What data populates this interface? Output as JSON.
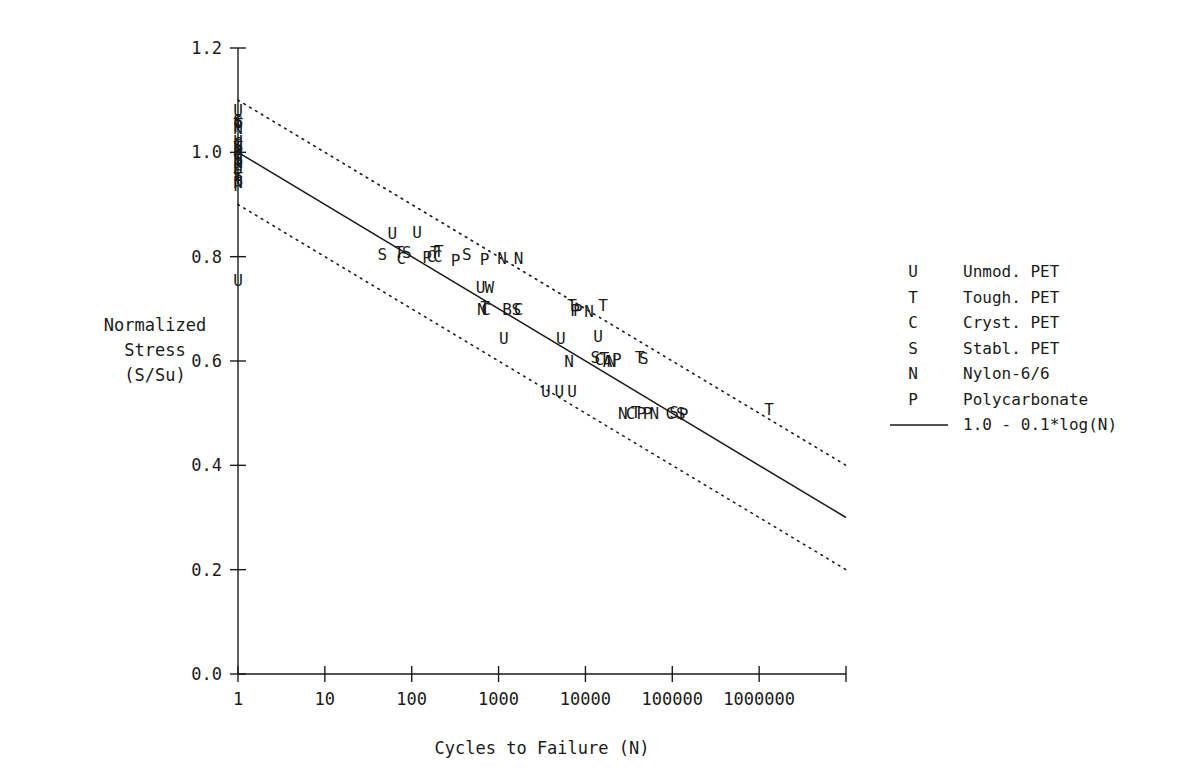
{
  "chart_data": {
    "type": "scatter",
    "title": "",
    "xlabel": "Cycles to Failure  (N)",
    "ylabel_lines": [
      "Normalized",
      "Stress",
      "(S/Su)"
    ],
    "xscale": "log",
    "xlim": [
      1,
      10000000
    ],
    "ylim": [
      0.0,
      1.2
    ],
    "grid": false,
    "x_ticks": [
      1,
      10,
      100,
      1000,
      10000,
      100000,
      1000000,
      10000000
    ],
    "x_tick_labels": [
      "1",
      "10",
      "100",
      "1000",
      "10000",
      "100000",
      "1000000",
      ""
    ],
    "y_ticks": [
      0.0,
      0.2,
      0.4,
      0.6,
      0.8,
      1.0,
      1.2
    ],
    "y_tick_labels": [
      "0.0",
      "0.2",
      "0.4",
      "0.6",
      "0.8",
      "1.0",
      "1.2"
    ],
    "legend_position": "right",
    "series": [
      {
        "name": "Unmod. PET",
        "key": "U"
      },
      {
        "name": "Tough. PET",
        "key": "T"
      },
      {
        "name": "Cryst. PET",
        "key": "C"
      },
      {
        "name": "Stabl. PET",
        "key": "S"
      },
      {
        "name": "Nylon-6/6",
        "key": "N"
      },
      {
        "name": "Polycarbonate",
        "key": "P"
      }
    ],
    "lines": [
      {
        "name": "1.0 - 0.1*log(N)",
        "style": "solid",
        "equation": "S/Su = 1.0 - 0.1*log10(N)",
        "points": [
          [
            1,
            1.0
          ],
          [
            10000000,
            0.3
          ]
        ]
      },
      {
        "name": "upper bound",
        "style": "dotted",
        "equation": "S/Su = 1.1 - 0.1*log10(N)",
        "points": [
          [
            1,
            1.1
          ],
          [
            10000000,
            0.4
          ]
        ]
      },
      {
        "name": "lower bound",
        "style": "dotted",
        "equation": "S/Su = 0.9 - 0.1*log10(N)",
        "points": [
          [
            1,
            0.9
          ],
          [
            10000000,
            0.2
          ]
        ]
      }
    ],
    "points": [
      {
        "k": "U",
        "x": 1,
        "y": 1.082
      },
      {
        "k": "S",
        "x": 1,
        "y": 1.062
      },
      {
        "k": "C",
        "x": 1,
        "y": 1.058
      },
      {
        "k": "T",
        "x": 1,
        "y": 1.054
      },
      {
        "k": "P",
        "x": 1,
        "y": 1.05
      },
      {
        "k": "N",
        "x": 1,
        "y": 1.046
      },
      {
        "k": "U",
        "x": 1,
        "y": 1.022
      },
      {
        "k": "C",
        "x": 1,
        "y": 1.018
      },
      {
        "k": "S",
        "x": 1,
        "y": 1.014
      },
      {
        "k": "T",
        "x": 1,
        "y": 1.01
      },
      {
        "k": "N",
        "x": 1,
        "y": 1.006
      },
      {
        "k": "P",
        "x": 1,
        "y": 1.002
      },
      {
        "k": "U",
        "x": 1,
        "y": 0.998
      },
      {
        "k": "C",
        "x": 1,
        "y": 0.994
      },
      {
        "k": "S",
        "x": 1,
        "y": 0.99
      },
      {
        "k": "T",
        "x": 1,
        "y": 0.986
      },
      {
        "k": "N",
        "x": 1,
        "y": 0.982
      },
      {
        "k": "P",
        "x": 1,
        "y": 0.978
      },
      {
        "k": "U",
        "x": 1,
        "y": 0.97
      },
      {
        "k": "C",
        "x": 1,
        "y": 0.962
      },
      {
        "k": "S",
        "x": 1,
        "y": 0.956
      },
      {
        "k": "T",
        "x": 1,
        "y": 0.95
      },
      {
        "k": "N",
        "x": 1,
        "y": 0.944
      },
      {
        "k": "P",
        "x": 1,
        "y": 0.938
      },
      {
        "k": "U",
        "x": 1,
        "y": 0.755
      },
      {
        "k": "U",
        "x": 60,
        "y": 0.845
      },
      {
        "k": "U",
        "x": 115,
        "y": 0.848
      },
      {
        "k": "S",
        "x": 46,
        "y": 0.805
      },
      {
        "k": "T",
        "x": 72,
        "y": 0.808
      },
      {
        "k": "C",
        "x": 76,
        "y": 0.797
      },
      {
        "k": "S",
        "x": 88,
        "y": 0.808
      },
      {
        "k": "P",
        "x": 150,
        "y": 0.8
      },
      {
        "k": "C",
        "x": 168,
        "y": 0.802
      },
      {
        "k": "T",
        "x": 185,
        "y": 0.808
      },
      {
        "k": "C",
        "x": 200,
        "y": 0.802
      },
      {
        "k": "T",
        "x": 205,
        "y": 0.81
      },
      {
        "k": "P",
        "x": 320,
        "y": 0.793
      },
      {
        "k": "S",
        "x": 430,
        "y": 0.805
      },
      {
        "k": "P",
        "x": 690,
        "y": 0.795
      },
      {
        "k": "N",
        "x": 1100,
        "y": 0.798
      },
      {
        "k": "N",
        "x": 1700,
        "y": 0.798
      },
      {
        "k": "U",
        "x": 620,
        "y": 0.742
      },
      {
        "k": "W",
        "x": 780,
        "y": 0.742
      },
      {
        "k": "N",
        "x": 640,
        "y": 0.7
      },
      {
        "k": "T",
        "x": 700,
        "y": 0.703
      },
      {
        "k": "C",
        "x": 720,
        "y": 0.7
      },
      {
        "k": "B",
        "x": 1250,
        "y": 0.7
      },
      {
        "k": "S",
        "x": 1600,
        "y": 0.7
      },
      {
        "k": "C",
        "x": 1700,
        "y": 0.7
      },
      {
        "k": "T",
        "x": 7000,
        "y": 0.707
      },
      {
        "k": "P",
        "x": 7600,
        "y": 0.698
      },
      {
        "k": "P",
        "x": 8200,
        "y": 0.698
      },
      {
        "k": "N",
        "x": 11000,
        "y": 0.695
      },
      {
        "k": "T",
        "x": 16000,
        "y": 0.707
      },
      {
        "k": "U",
        "x": 1150,
        "y": 0.645
      },
      {
        "k": "U",
        "x": 5200,
        "y": 0.645
      },
      {
        "k": "U",
        "x": 14000,
        "y": 0.648
      },
      {
        "k": "N",
        "x": 6500,
        "y": 0.6
      },
      {
        "k": "S",
        "x": 13000,
        "y": 0.607
      },
      {
        "k": "C",
        "x": 14500,
        "y": 0.603
      },
      {
        "k": "T",
        "x": 16500,
        "y": 0.605
      },
      {
        "k": "A",
        "x": 18000,
        "y": 0.6
      },
      {
        "k": "N",
        "x": 20000,
        "y": 0.6
      },
      {
        "k": "P",
        "x": 23000,
        "y": 0.603
      },
      {
        "k": "T",
        "x": 42000,
        "y": 0.607
      },
      {
        "k": "S",
        "x": 47000,
        "y": 0.605
      },
      {
        "k": "U",
        "x": 3500,
        "y": 0.543
      },
      {
        "k": "U",
        "x": 5000,
        "y": 0.543
      },
      {
        "k": "U",
        "x": 7000,
        "y": 0.543
      },
      {
        "k": "N",
        "x": 27000,
        "y": 0.5
      },
      {
        "k": "C",
        "x": 33000,
        "y": 0.5
      },
      {
        "k": "T",
        "x": 38000,
        "y": 0.502
      },
      {
        "k": "P",
        "x": 44000,
        "y": 0.5
      },
      {
        "k": "P",
        "x": 52000,
        "y": 0.5
      },
      {
        "k": "N",
        "x": 62000,
        "y": 0.5
      },
      {
        "k": "C",
        "x": 95000,
        "y": 0.5
      },
      {
        "k": "S",
        "x": 105000,
        "y": 0.502
      },
      {
        "k": "S",
        "x": 125000,
        "y": 0.5
      },
      {
        "k": "P",
        "x": 135000,
        "y": 0.498
      },
      {
        "k": "T",
        "x": 1300000,
        "y": 0.508
      }
    ]
  },
  "legend": {
    "entries": [
      {
        "key": "U",
        "label": "Unmod. PET"
      },
      {
        "key": "T",
        "label": "Tough. PET"
      },
      {
        "key": "C",
        "label": "Cryst. PET"
      },
      {
        "key": "S",
        "label": "Stabl. PET"
      },
      {
        "key": "N",
        "label": "Nylon-6/6"
      },
      {
        "key": "P",
        "label": "Polycarbonate"
      }
    ],
    "line_entry_label": "1.0 - 0.1*log(N)"
  },
  "colors": {
    "foreground": "#1a1a1a",
    "background": "#ffffff"
  }
}
